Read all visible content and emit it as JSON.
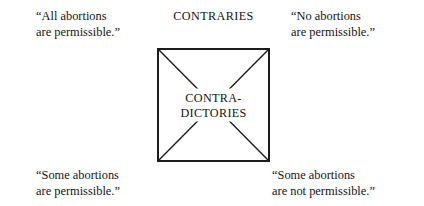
{
  "figure": {
    "type": "square-of-opposition-diagram",
    "background_color": "#ffffff",
    "line_color": "#1c1c1c",
    "text_color": "#141414"
  },
  "relations": {
    "contraries_label": "CONTRARIES",
    "contradictories_label_line1": "CONTRA-",
    "contradictories_label_line2": "DICTORIES"
  },
  "propositions": {
    "top_left": {
      "line1": "“All abortions",
      "line2": "are permissible.”"
    },
    "top_right": {
      "line1": "“No abortions",
      "line2": "are permissible.”"
    },
    "bottom_left": {
      "line1": "“Some abortions",
      "line2": "are permissible.”"
    },
    "bottom_right": {
      "line1": "“Some abortions",
      "line2": "are not permissible.”"
    }
  }
}
